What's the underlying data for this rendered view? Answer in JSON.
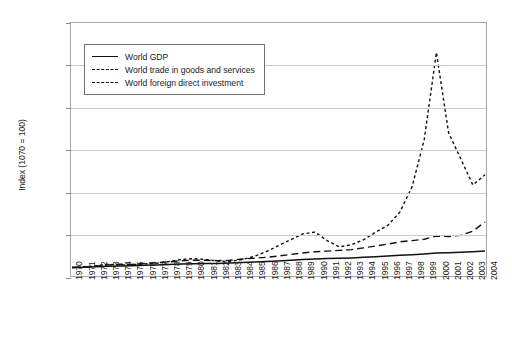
{
  "chart_data": {
    "type": "line",
    "title": "Growth of world GDP, trade and foreign direct investment, 1970-2004 (index 1970 = 100)",
    "xlabel": "",
    "ylabel": "Index (1070 = 100)",
    "ylim": [
      0,
      3000
    ],
    "ytick_labels": [
      "0",
      "500",
      "1,000",
      "1,500",
      "2,000",
      "2,500",
      "3,000"
    ],
    "ytick_values": [
      0,
      500,
      1000,
      1500,
      2000,
      2500,
      3000
    ],
    "grid": true,
    "legend_position": "upper-left-inside",
    "x": [
      1970,
      1971,
      1972,
      1973,
      1974,
      1975,
      1976,
      1977,
      1978,
      1979,
      1980,
      1981,
      1982,
      1983,
      1984,
      1985,
      1986,
      1987,
      1988,
      1989,
      1990,
      1991,
      1992,
      1993,
      1994,
      1995,
      1996,
      1997,
      1998,
      1999,
      2000,
      2001,
      2002,
      2003,
      2004
    ],
    "categories": [
      "1970",
      "1971",
      "1972",
      "1973",
      "1974",
      "1975",
      "1976",
      "1977",
      "1978",
      "1979",
      "1980",
      "1981",
      "1982",
      "1983",
      "1984",
      "1985",
      "1986",
      "1987",
      "1988",
      "1989",
      "1990",
      "1991",
      "1992",
      "1993",
      "1994",
      "1995",
      "1996",
      "1997",
      "1998",
      "1999",
      "2000",
      "2001",
      "2002",
      "2003",
      "2004"
    ],
    "series": [
      {
        "name": "World GDP",
        "style": "solid",
        "values": [
          100,
          104,
          109,
          116,
          119,
          121,
          126,
          131,
          137,
          143,
          146,
          148,
          149,
          153,
          160,
          166,
          172,
          179,
          188,
          196,
          203,
          207,
          210,
          214,
          221,
          228,
          236,
          245,
          252,
          261,
          272,
          276,
          281,
          288,
          296
        ]
      },
      {
        "name": "World trade in goods and services",
        "style": "long-dash",
        "values": [
          100,
          108,
          118,
          132,
          139,
          138,
          150,
          158,
          168,
          181,
          188,
          186,
          182,
          186,
          201,
          211,
          222,
          237,
          256,
          273,
          288,
          295,
          304,
          313,
          334,
          356,
          378,
          405,
          420,
          436,
          474,
          468,
          482,
          532,
          640
        ]
      },
      {
        "name": "World foreign direct investment",
        "style": "short-dash",
        "values": [
          100,
          110,
          122,
          140,
          130,
          136,
          144,
          152,
          172,
          196,
          206,
          196,
          176,
          172,
          196,
          232,
          290,
          360,
          430,
          500,
          520,
          420,
          345,
          370,
          430,
          520,
          600,
          760,
          1060,
          1620,
          2650,
          1700,
          1390,
          1080,
          1200
        ]
      }
    ]
  },
  "legend": {
    "items": [
      {
        "label": "World GDP",
        "style": "solid"
      },
      {
        "label": "World trade in goods and services",
        "style": "long-dash"
      },
      {
        "label": "World foreign direct investment",
        "style": "short-dash"
      }
    ]
  }
}
